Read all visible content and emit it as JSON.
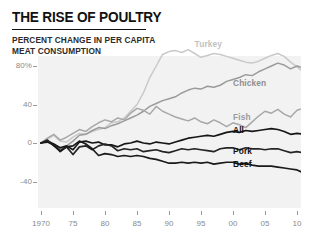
{
  "header": {
    "title": "THE RISE OF POULTRY",
    "subtitle": "PERCENT CHANGE IN PER CAPITA\nMEAT CONSUMPTION"
  },
  "chart_data": {
    "type": "line",
    "title": "THE RISE OF POULTRY",
    "subtitle": "PERCENT CHANGE IN PER CAPITA MEAT CONSUMPTION",
    "xlabel": "",
    "ylabel": "",
    "grid": false,
    "legend_position": "inline-right",
    "xlim": [
      1970,
      2011
    ],
    "ylim": [
      -52,
      96
    ],
    "yticks": [
      80,
      40,
      0,
      -40
    ],
    "ytick_labels": [
      "80%",
      "40",
      "0",
      "-40"
    ],
    "xticks": [
      1970,
      1975,
      1980,
      1985,
      1990,
      1995,
      2000,
      2005,
      2010
    ],
    "xtick_labels": [
      "1970",
      "75",
      "80",
      "85",
      "90",
      "95",
      "00",
      "05",
      "10"
    ],
    "x": [
      1970,
      1971,
      1972,
      1973,
      1974,
      1975,
      1976,
      1977,
      1978,
      1979,
      1980,
      1981,
      1982,
      1983,
      1984,
      1985,
      1986,
      1987,
      1988,
      1989,
      1990,
      1991,
      1992,
      1993,
      1994,
      1995,
      1996,
      1997,
      1998,
      1999,
      2000,
      2001,
      2002,
      2003,
      2004,
      2005,
      2006,
      2007,
      2008,
      2009,
      2010,
      2011
    ],
    "series": [
      {
        "name": "Turkey",
        "color": "#c9c9c9",
        "label_color": "#c2c2c2",
        "values": [
          0,
          4,
          8,
          2,
          1,
          6,
          10,
          9,
          12,
          14,
          16,
          21,
          22,
          26,
          33,
          40,
          52,
          68,
          80,
          92,
          95,
          96,
          94,
          97,
          93,
          89,
          91,
          93,
          92,
          90,
          88,
          86,
          84,
          83,
          85,
          88,
          91,
          93,
          90,
          84,
          79,
          74
        ]
      },
      {
        "name": "Chicken",
        "color": "#9b9b9b",
        "label_color": "#8f8f8f",
        "values": [
          0,
          3,
          -2,
          -6,
          -3,
          2,
          8,
          9,
          13,
          16,
          15,
          18,
          20,
          23,
          26,
          29,
          33,
          38,
          41,
          44,
          46,
          48,
          52,
          55,
          57,
          56,
          59,
          58,
          60,
          64,
          66,
          68,
          71,
          70,
          74,
          77,
          80,
          83,
          81,
          77,
          80,
          78
        ]
      },
      {
        "name": "Fish",
        "color": "#a8a8a8",
        "label_color": "#9a9a9a",
        "values": [
          0,
          5,
          9,
          3,
          6,
          10,
          14,
          12,
          17,
          21,
          24,
          22,
          26,
          24,
          31,
          36,
          34,
          30,
          38,
          33,
          30,
          27,
          25,
          23,
          26,
          22,
          20,
          24,
          21,
          17,
          21,
          19,
          16,
          22,
          28,
          33,
          31,
          35,
          30,
          27,
          34,
          36
        ]
      },
      {
        "name": "All",
        "color": "#161616",
        "label_color": "#111111",
        "values": [
          0,
          2,
          -1,
          -5,
          -3,
          -7,
          1,
          2,
          0,
          1,
          -2,
          -2,
          -4,
          -1,
          0,
          2,
          0,
          -1,
          1,
          0,
          -1,
          1,
          3,
          5,
          6,
          7,
          8,
          7,
          9,
          11,
          12,
          11,
          13,
          12,
          13,
          14,
          15,
          14,
          12,
          9,
          10,
          9
        ]
      },
      {
        "name": "Pork",
        "color": "#242424",
        "label_color": "#111111",
        "values": [
          0,
          3,
          -3,
          -8,
          -4,
          -12,
          -4,
          -3,
          -7,
          -3,
          -1,
          -3,
          -8,
          -6,
          -7,
          -6,
          -9,
          -8,
          -7,
          -9,
          -10,
          -8,
          -6,
          -7,
          -6,
          -7,
          -8,
          -9,
          -6,
          -5,
          -5,
          -7,
          -5,
          -6,
          -6,
          -7,
          -6,
          -6,
          -8,
          -10,
          -9,
          -10
        ]
      },
      {
        "name": "Beef",
        "color": "#1a1a1a",
        "label_color": "#111111",
        "values": [
          0,
          1,
          -2,
          -9,
          -4,
          -3,
          2,
          -1,
          -6,
          -13,
          -11,
          -12,
          -14,
          -13,
          -14,
          -13,
          -14,
          -16,
          -17,
          -19,
          -21,
          -21,
          -20,
          -21,
          -20,
          -21,
          -20,
          -22,
          -21,
          -20,
          -20,
          -22,
          -21,
          -23,
          -24,
          -24,
          -24,
          -25,
          -26,
          -27,
          -28,
          -31
        ]
      }
    ],
    "annotations": [
      {
        "text": "Turkey",
        "x": 1994,
        "y": 103
      },
      {
        "text": "Chicken",
        "x": 2000,
        "y": 62
      },
      {
        "text": "Fish",
        "x": 2000,
        "y": 27
      },
      {
        "text": "All",
        "x": 2000,
        "y": 14
      },
      {
        "text": "Pork",
        "x": 2000,
        "y": -8
      },
      {
        "text": "Beef",
        "x": 2000,
        "y": -22
      }
    ]
  }
}
